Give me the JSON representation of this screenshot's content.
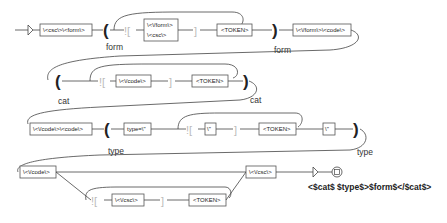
{
  "graph": {
    "row1": {
      "start_box": "\\<csc\\>\\<form\\>",
      "open_paren": "(",
      "context_open": "![",
      "alt_box_line1": "\\<\\/form\\>",
      "alt_box_line2": "\\<csc\\>",
      "context_close": "]",
      "token_box": "<TOKEN>",
      "close_paren": ")",
      "end_box": "\\<\\/form\\>\\<code\\>",
      "var_label_open": "form",
      "var_label_close": "form"
    },
    "row2": {
      "open_paren": "(",
      "context_open": "![",
      "code_box": "\\<\\/code\\>",
      "context_close": "]",
      "token_box": "<TOKEN>",
      "close_paren": ")",
      "var_label_open": "cat",
      "var_label_close": "cat"
    },
    "row3": {
      "start_box": "\\<\\/code\\>\\<code\\>",
      "open_paren": "(",
      "type_box": "type=\\\"",
      "context_open": "![",
      "quote_box": "\\\"",
      "context_close": "]",
      "token_box": "<TOKEN>",
      "quote_box2": "\\\"",
      "close_paren": ")",
      "var_label_open": "type",
      "var_label_close": "type"
    },
    "row4": {
      "code_box": "\\<\\/code\\>",
      "context_open": "![",
      "csc_box": "\\<\\/csc\\>",
      "context_close": "]",
      "token_box": "<TOKEN>",
      "end_csc_box": "\\<\\/csc\\>",
      "output": "<$cat$ $type$>$form$</$cat$>"
    }
  }
}
